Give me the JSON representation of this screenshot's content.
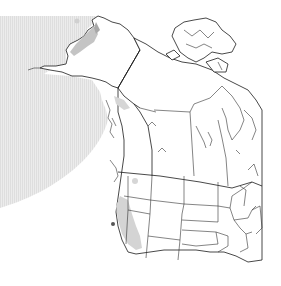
{
  "map": {
    "type": "range-map",
    "region": "Western North America",
    "legend": [],
    "colors": {
      "background": "#ffffff",
      "ocean_range": "#e6e6e6",
      "ocean_stripe": "#dcdcdc",
      "core_range": "#c4c4c4",
      "border": "#1a1a1a"
    },
    "layers": [
      {
        "name": "offshore-range",
        "fill": "#e6e6e6"
      },
      {
        "name": "coastal-core-range",
        "fill": "#c4c4c4"
      },
      {
        "name": "political-borders",
        "stroke": "#1a1a1a"
      }
    ]
  }
}
